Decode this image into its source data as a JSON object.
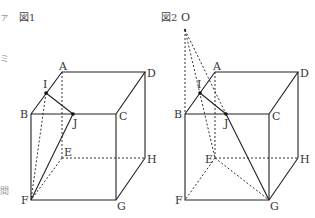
{
  "figures": [
    {
      "caption": "図1",
      "labels": {
        "A": "A",
        "B": "B",
        "C": "C",
        "D": "D",
        "E": "E",
        "F": "F",
        "G": "G",
        "H": "H",
        "I": "I",
        "J": "J"
      }
    },
    {
      "caption": "図2",
      "labels": {
        "O": "O",
        "A": "A",
        "B": "B",
        "C": "C",
        "D": "D",
        "E": "E",
        "F": "F",
        "G": "G",
        "H": "H",
        "I": "I",
        "J": "J"
      }
    }
  ],
  "margin_marks": [
    "ァ",
    "ェ",
    "ミ",
    "間"
  ]
}
